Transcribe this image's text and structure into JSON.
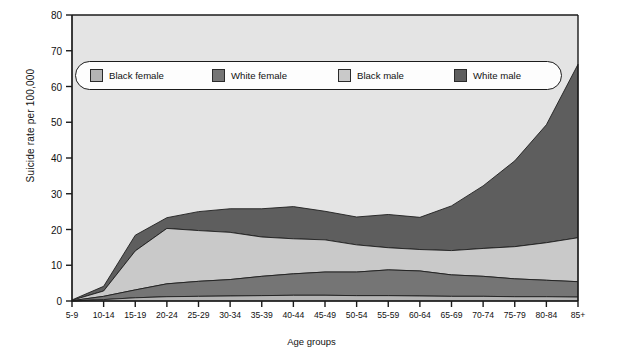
{
  "chart_data": {
    "type": "area",
    "stacked": true,
    "title": "",
    "xlabel": "Age groups",
    "ylabel": "Suicide rate per 100,000",
    "ylim": [
      0,
      80
    ],
    "yticks": [
      0,
      10,
      20,
      30,
      40,
      50,
      60,
      70,
      80
    ],
    "grid": false,
    "legend_position": "top-inside",
    "categories": [
      "5-9",
      "10-14",
      "15-19",
      "20-24",
      "25-29",
      "30-34",
      "35-39",
      "40-44",
      "45-49",
      "50-54",
      "55-59",
      "60-64",
      "65-69",
      "70-74",
      "75-79",
      "80-84",
      "85+"
    ],
    "series": [
      {
        "name": "Black female",
        "color": "#b4b4b4",
        "values": [
          0.0,
          0.4,
          0.9,
          1.2,
          1.3,
          1.4,
          1.5,
          1.6,
          1.6,
          1.5,
          1.5,
          1.4,
          1.3,
          1.3,
          1.2,
          1.2,
          1.1
        ]
      },
      {
        "name": "White female",
        "color": "#757575",
        "values": [
          0.1,
          0.9,
          2.2,
          3.6,
          4.2,
          4.6,
          5.4,
          6.0,
          6.5,
          6.6,
          7.2,
          7.0,
          6.0,
          5.6,
          5.0,
          4.6,
          4.3
        ]
      },
      {
        "name": "Black male",
        "color": "#c9c9c9",
        "values": [
          0.1,
          1.5,
          10.9,
          15.5,
          14.2,
          13.2,
          11.0,
          9.8,
          9.0,
          7.6,
          6.2,
          6.0,
          6.8,
          7.8,
          9.0,
          10.5,
          12.3
        ]
      },
      {
        "name": "White male",
        "color": "#5e5e5e",
        "values": [
          0.1,
          1.3,
          4.4,
          3.0,
          5.3,
          6.6,
          7.9,
          9.0,
          8.0,
          7.8,
          9.3,
          9.0,
          12.5,
          17.5,
          24.0,
          33.0,
          48.5
        ]
      }
    ],
    "totals": [
      0.3,
      4.1,
      18.4,
      23.3,
      25.0,
      25.8,
      25.8,
      26.4,
      25.1,
      23.5,
      24.2,
      23.4,
      26.6,
      32.2,
      39.2,
      49.3,
      66.2
    ],
    "top_band_upper": [
      0.3,
      4.1,
      18.4,
      23.3,
      25.0,
      25.8,
      25.8,
      26.4,
      25.1,
      23.5,
      24.2,
      23.4,
      26.6,
      32.2,
      39.2,
      49.3,
      66.2
    ],
    "cumulative_black_female": [
      0.0,
      0.4,
      0.9,
      1.2,
      1.3,
      1.4,
      1.5,
      1.6,
      1.6,
      1.5,
      1.5,
      1.4,
      1.3,
      1.3,
      1.2,
      1.2,
      1.1
    ],
    "cumulative_white_female": [
      0.1,
      1.3,
      3.1,
      4.8,
      5.5,
      6.0,
      6.9,
      7.6,
      8.1,
      8.1,
      8.7,
      8.4,
      7.3,
      6.9,
      6.2,
      5.8,
      5.4
    ],
    "cumulative_black_male": [
      0.2,
      2.8,
      14.0,
      20.3,
      19.7,
      19.2,
      17.9,
      17.4,
      17.1,
      15.7,
      14.9,
      14.4,
      14.1,
      14.7,
      15.2,
      16.3,
      17.7
    ]
  },
  "legend": {
    "items": [
      {
        "label": "Black female",
        "color": "#b4b4b4"
      },
      {
        "label": "White female",
        "color": "#757575"
      },
      {
        "label": "Black male",
        "color": "#c9c9c9"
      },
      {
        "label": "White male",
        "color": "#5e5e5e"
      }
    ]
  },
  "axes": {
    "y_title": "Suicide rate per 100,000",
    "x_title": "Age groups",
    "y_ticks": [
      "80",
      "70",
      "60",
      "50",
      "40",
      "30",
      "20",
      "10",
      "0"
    ],
    "x_ticks": [
      "5-9",
      "10-14",
      "15-19",
      "20-24",
      "25-29",
      "30-34",
      "35-39",
      "40-44",
      "45-49",
      "50-54",
      "55-59",
      "60-64",
      "65-69",
      "70-74",
      "75-79",
      "80-84",
      "85+"
    ]
  },
  "style": {
    "plot_background": "#e4e4e4",
    "axis_color": "#1b1b1b",
    "text_color": "#111111"
  }
}
